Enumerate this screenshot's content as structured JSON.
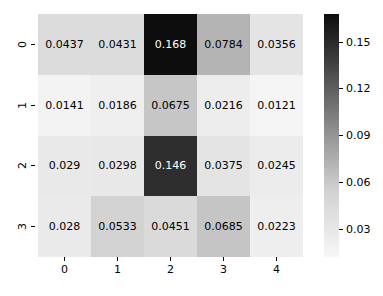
{
  "chart_data": {
    "type": "heatmap",
    "title": "",
    "xlabel": "",
    "ylabel": "",
    "x_tick_labels": [
      "0",
      "1",
      "2",
      "3",
      "4"
    ],
    "y_tick_labels": [
      "0",
      "1",
      "2",
      "3"
    ],
    "colormap": "gray_r",
    "grid": false,
    "annotated": true,
    "values": [
      [
        0.0437,
        0.0431,
        0.168,
        0.0784,
        0.0356
      ],
      [
        0.0141,
        0.0186,
        0.0675,
        0.0216,
        0.0121
      ],
      [
        0.029,
        0.0298,
        0.146,
        0.0375,
        0.0245
      ],
      [
        0.028,
        0.0533,
        0.0451,
        0.0685,
        0.0223
      ]
    ],
    "cell_labels": [
      [
        "0.0437",
        "0.0431",
        "0.168",
        "0.0784",
        "0.0356"
      ],
      [
        "0.0141",
        "0.0186",
        "0.0675",
        "0.0216",
        "0.0121"
      ],
      [
        "0.029",
        "0.0298",
        "0.146",
        "0.0375",
        "0.0245"
      ],
      [
        "0.028",
        "0.0533",
        "0.0451",
        "0.0685",
        "0.0223"
      ]
    ],
    "cell_fill_colors": [
      [
        "#dcdcdc",
        "#dcdcdc",
        "#0d0d0d",
        "#b4b4b4",
        "#e4e4e4"
      ],
      [
        "#f3f3f3",
        "#efefef",
        "#c6c6c6",
        "#ededed",
        "#f5f5f5"
      ],
      [
        "#e9e9e9",
        "#e8e8e8",
        "#2e2e2e",
        "#e4e4e4",
        "#ececec"
      ],
      [
        "#eaeaea",
        "#d3d3d3",
        "#dadada",
        "#c5c5c5",
        "#eeeeee"
      ]
    ],
    "cell_text_colors": [
      [
        "#000000",
        "#000000",
        "#ffffff",
        "#000000",
        "#000000"
      ],
      [
        "#000000",
        "#000000",
        "#000000",
        "#000000",
        "#000000"
      ],
      [
        "#000000",
        "#000000",
        "#ffffff",
        "#000000",
        "#000000"
      ],
      [
        "#000000",
        "#000000",
        "#000000",
        "#000000",
        "#000000"
      ]
    ],
    "colorbar": {
      "orientation": "vertical",
      "position": "right",
      "tick_labels": [
        "0.15",
        "0.12",
        "0.09",
        "0.06",
        "0.03"
      ],
      "tick_values": [
        0.15,
        0.12,
        0.09,
        0.06,
        0.03
      ],
      "vmin": 0.0121,
      "vmax": 0.168,
      "gradient_top_color": "#0d0d0d",
      "gradient_bottom_color": "#f7f7f7"
    },
    "background_color": "#ffffff"
  }
}
